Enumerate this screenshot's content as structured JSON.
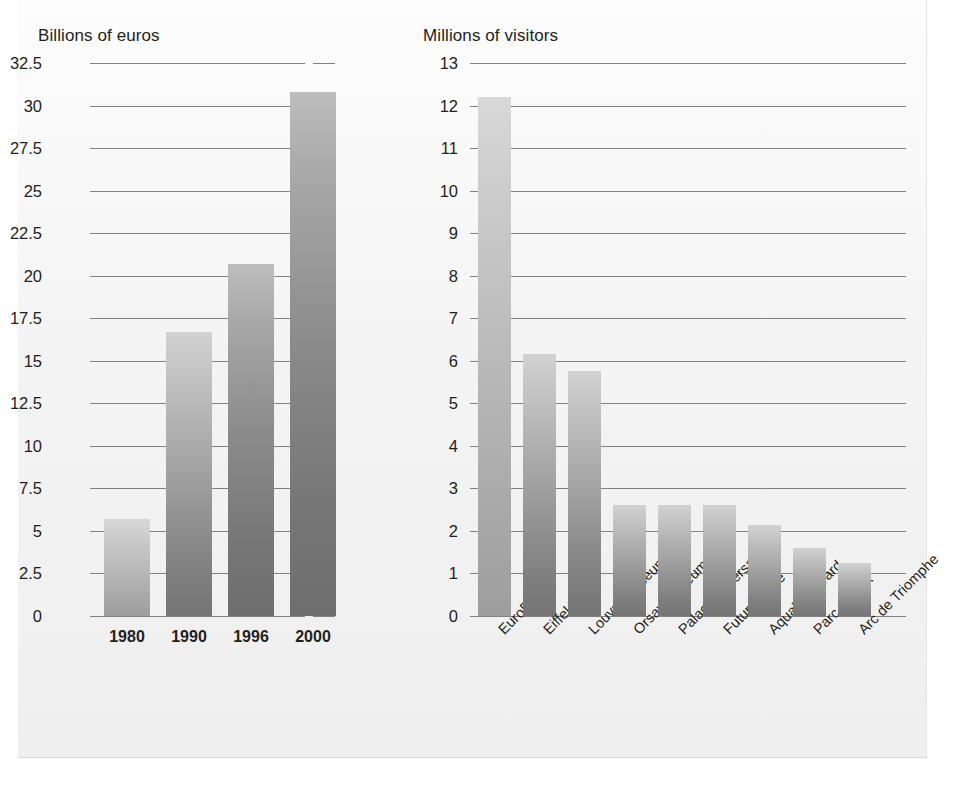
{
  "chart_data": [
    {
      "type": "bar",
      "title": "Billions of euros",
      "xlabel": "",
      "ylabel": "Billions of euros",
      "categories": [
        "1980",
        "1990",
        "1996",
        "2000"
      ],
      "values": [
        5.7,
        16.7,
        20.7,
        30.8
      ],
      "yticks": [
        "0",
        "2.5",
        "5",
        "7.5",
        "10",
        "12.5",
        "15",
        "17.5",
        "20",
        "22.5",
        "25",
        "27.5",
        "30",
        "32.5"
      ],
      "ytick_values": [
        0,
        2.5,
        5,
        7.5,
        10,
        12.5,
        15,
        17.5,
        20,
        22.5,
        25,
        27.5,
        30,
        32.5
      ],
      "ylim": [
        0,
        32.5
      ],
      "grid": true,
      "legend": "none",
      "bar_color": "#9c9c9c"
    },
    {
      "type": "bar",
      "title": "Millions of visitors",
      "xlabel": "",
      "ylabel": "Millions of visitors",
      "categories": [
        "EuroDisney",
        "Eiffel Tower",
        "Louvre Museum",
        "Orsay Museum",
        "Palace of Versailles",
        "Futuroscope",
        "Aquaboulevard",
        "Parc Asterix",
        "Arc de Triomphe"
      ],
      "values": [
        12.2,
        6.15,
        5.75,
        2.6,
        2.6,
        2.6,
        2.15,
        1.6,
        1.25
      ],
      "yticks": [
        "0",
        "1",
        "2",
        "3",
        "4",
        "5",
        "6",
        "7",
        "8",
        "9",
        "10",
        "11",
        "12",
        "13"
      ],
      "ytick_values": [
        0,
        1,
        2,
        3,
        4,
        5,
        6,
        7,
        8,
        9,
        10,
        11,
        12,
        13
      ],
      "ylim": [
        0,
        13
      ],
      "grid": true,
      "legend": "none",
      "bar_color": "#9c9c9c"
    }
  ],
  "left_chart": {
    "title": "Billions of euros",
    "yticks": [
      "32.5",
      "30",
      "27.5",
      "25",
      "22.5",
      "20",
      "17.5",
      "15",
      "12.5",
      "10",
      "7.5",
      "5",
      "2.5",
      "0"
    ],
    "xlabels": [
      "1980",
      "1990",
      "1996",
      "2000"
    ]
  },
  "right_chart": {
    "title": "Millions of visitors",
    "yticks": [
      "13",
      "12",
      "11",
      "10",
      "9",
      "8",
      "7",
      "6",
      "5",
      "4",
      "3",
      "2",
      "1",
      "0"
    ],
    "xlabels": [
      "EuroDisney",
      "Eiffel Tower",
      "Louvre Museum",
      "Orsay Museum",
      "Palace of Versailles",
      "Futuroscope",
      "Aquaboulevard",
      "Parc Asterix",
      "Arc de Triomphe"
    ]
  },
  "colors": {
    "plate_background": "#f4f4f4",
    "gridline": "#6d6d6d",
    "text": "#231f20",
    "bar_top": "#d2d2d2",
    "bar_bottom": "#757575"
  }
}
